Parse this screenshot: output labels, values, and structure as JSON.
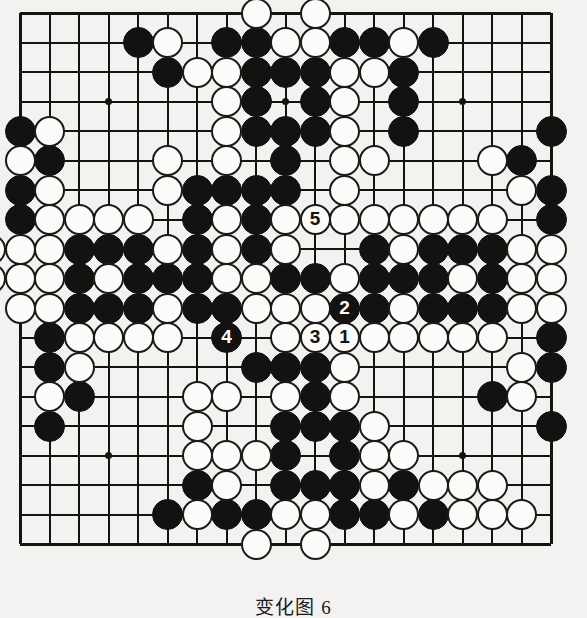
{
  "figure": {
    "caption": "变化图 6",
    "kind": "go-board-diagram",
    "board_size": 19,
    "colors": {
      "black_stone": "#131210",
      "white_stone": "#fbfbf9",
      "line": "#15130f",
      "background": "#f3f2f0"
    },
    "grid": {
      "origin_x": 20,
      "origin_y": 13,
      "spacing": 29.5,
      "star_points": [
        [
          3,
          3
        ],
        [
          9,
          3
        ],
        [
          15,
          3
        ],
        [
          3,
          9
        ],
        [
          9,
          9
        ],
        [
          15,
          9
        ],
        [
          3,
          15
        ],
        [
          9,
          15
        ],
        [
          15,
          15
        ]
      ]
    },
    "moves": [
      {
        "label": "1",
        "color": "white",
        "col": 11,
        "row": 11
      },
      {
        "label": "2",
        "color": "black",
        "col": 11,
        "row": 10
      },
      {
        "label": "3",
        "color": "white",
        "col": 10,
        "row": 11
      },
      {
        "label": "4",
        "color": "black",
        "col": 7,
        "row": 11
      },
      {
        "label": "5",
        "color": "white",
        "col": 10,
        "row": 7
      }
    ],
    "black_stones": [
      [
        4,
        1
      ],
      [
        7,
        1
      ],
      [
        8,
        1
      ],
      [
        11,
        1
      ],
      [
        12,
        1
      ],
      [
        14,
        1
      ],
      [
        5,
        2
      ],
      [
        8,
        2
      ],
      [
        9,
        2
      ],
      [
        10,
        2
      ],
      [
        13,
        2
      ],
      [
        8,
        3
      ],
      [
        10,
        3
      ],
      [
        13,
        3
      ],
      [
        0,
        4
      ],
      [
        8,
        4
      ],
      [
        9,
        4
      ],
      [
        10,
        4
      ],
      [
        13,
        4
      ],
      [
        18,
        4
      ],
      [
        1,
        5
      ],
      [
        9,
        5
      ],
      [
        17,
        5
      ],
      [
        0,
        6
      ],
      [
        6,
        6
      ],
      [
        7,
        6
      ],
      [
        8,
        6
      ],
      [
        9,
        6
      ],
      [
        18,
        6
      ],
      [
        0,
        7
      ],
      [
        6,
        7
      ],
      [
        8,
        7
      ],
      [
        18,
        7
      ],
      [
        2,
        8
      ],
      [
        3,
        8
      ],
      [
        4,
        8
      ],
      [
        6,
        8
      ],
      [
        8,
        8
      ],
      [
        12,
        8
      ],
      [
        14,
        8
      ],
      [
        15,
        8
      ],
      [
        16,
        8
      ],
      [
        2,
        9
      ],
      [
        4,
        9
      ],
      [
        5,
        9
      ],
      [
        6,
        9
      ],
      [
        9,
        9
      ],
      [
        10,
        9
      ],
      [
        12,
        9
      ],
      [
        13,
        9
      ],
      [
        14,
        9
      ],
      [
        16,
        9
      ],
      [
        2,
        10
      ],
      [
        3,
        10
      ],
      [
        4,
        10
      ],
      [
        6,
        10
      ],
      [
        7,
        10
      ],
      [
        12,
        10
      ],
      [
        14,
        10
      ],
      [
        15,
        10
      ],
      [
        16,
        10
      ],
      [
        1,
        11
      ],
      [
        18,
        11
      ],
      [
        1,
        12
      ],
      [
        8,
        12
      ],
      [
        9,
        12
      ],
      [
        10,
        12
      ],
      [
        18,
        12
      ],
      [
        2,
        13
      ],
      [
        10,
        13
      ],
      [
        16,
        13
      ],
      [
        1,
        14
      ],
      [
        9,
        14
      ],
      [
        10,
        14
      ],
      [
        11,
        14
      ],
      [
        18,
        14
      ],
      [
        9,
        15
      ],
      [
        11,
        15
      ],
      [
        6,
        16
      ],
      [
        9,
        16
      ],
      [
        10,
        16
      ],
      [
        11,
        16
      ],
      [
        13,
        16
      ],
      [
        5,
        17
      ],
      [
        7,
        17
      ],
      [
        8,
        17
      ],
      [
        11,
        17
      ],
      [
        12,
        17
      ],
      [
        14,
        17
      ]
    ],
    "white_stones": [
      [
        8,
        0
      ],
      [
        10,
        0
      ],
      [
        5,
        1
      ],
      [
        9,
        1
      ],
      [
        10,
        1
      ],
      [
        13,
        1
      ],
      [
        6,
        2
      ],
      [
        7,
        2
      ],
      [
        11,
        2
      ],
      [
        12,
        2
      ],
      [
        7,
        3
      ],
      [
        11,
        3
      ],
      [
        1,
        4
      ],
      [
        7,
        4
      ],
      [
        11,
        4
      ],
      [
        0,
        5
      ],
      [
        5,
        5
      ],
      [
        7,
        5
      ],
      [
        11,
        5
      ],
      [
        12,
        5
      ],
      [
        16,
        5
      ],
      [
        1,
        6
      ],
      [
        5,
        6
      ],
      [
        11,
        6
      ],
      [
        17,
        6
      ],
      [
        1,
        7
      ],
      [
        2,
        7
      ],
      [
        3,
        7
      ],
      [
        4,
        7
      ],
      [
        7,
        7
      ],
      [
        9,
        7
      ],
      [
        11,
        7
      ],
      [
        12,
        7
      ],
      [
        13,
        7
      ],
      [
        14,
        7
      ],
      [
        15,
        7
      ],
      [
        16,
        7
      ],
      [
        -1,
        8
      ],
      [
        0,
        8
      ],
      [
        1,
        8
      ],
      [
        5,
        8
      ],
      [
        7,
        8
      ],
      [
        9,
        8
      ],
      [
        13,
        8
      ],
      [
        17,
        8
      ],
      [
        18,
        8
      ],
      [
        -1,
        9
      ],
      [
        0,
        9
      ],
      [
        1,
        9
      ],
      [
        3,
        9
      ],
      [
        7,
        9
      ],
      [
        8,
        9
      ],
      [
        11,
        9
      ],
      [
        15,
        9
      ],
      [
        17,
        9
      ],
      [
        18,
        9
      ],
      [
        0,
        10
      ],
      [
        1,
        10
      ],
      [
        5,
        10
      ],
      [
        8,
        10
      ],
      [
        9,
        10
      ],
      [
        10,
        10
      ],
      [
        11,
        10
      ],
      [
        13,
        10
      ],
      [
        17,
        10
      ],
      [
        18,
        10
      ],
      [
        2,
        11
      ],
      [
        3,
        11
      ],
      [
        4,
        11
      ],
      [
        5,
        11
      ],
      [
        9,
        11
      ],
      [
        12,
        11
      ],
      [
        13,
        11
      ],
      [
        14,
        11
      ],
      [
        15,
        11
      ],
      [
        16,
        11
      ],
      [
        2,
        12
      ],
      [
        11,
        12
      ],
      [
        17,
        12
      ],
      [
        1,
        13
      ],
      [
        6,
        13
      ],
      [
        7,
        13
      ],
      [
        9,
        13
      ],
      [
        11,
        13
      ],
      [
        17,
        13
      ],
      [
        6,
        14
      ],
      [
        12,
        14
      ],
      [
        6,
        15
      ],
      [
        7,
        15
      ],
      [
        8,
        15
      ],
      [
        12,
        15
      ],
      [
        13,
        15
      ],
      [
        7,
        16
      ],
      [
        12,
        16
      ],
      [
        14,
        16
      ],
      [
        15,
        16
      ],
      [
        16,
        16
      ],
      [
        6,
        17
      ],
      [
        9,
        17
      ],
      [
        10,
        17
      ],
      [
        13,
        17
      ],
      [
        15,
        17
      ],
      [
        16,
        17
      ],
      [
        17,
        17
      ],
      [
        8,
        18
      ],
      [
        10,
        18
      ]
    ]
  }
}
